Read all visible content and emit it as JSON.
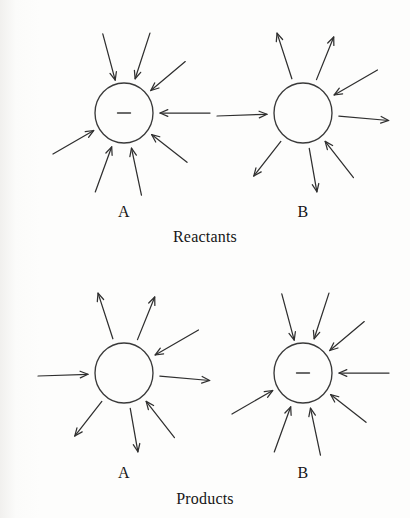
{
  "figure": {
    "kind": "reaction-energy-diagram",
    "page_background": "#fdfdfc",
    "ink_color": "#2f2f2f",
    "rows": [
      {
        "id": "reactants",
        "caption": "Reactants",
        "caption_x": 205,
        "caption_y": 228,
        "groups": [
          {
            "id": "reactant-a",
            "label": "A",
            "label_x": 124,
            "label_y": 203,
            "diagram_x": 28,
            "diagram_y": 8,
            "circle": {
              "cx": 96,
              "cy": 105,
              "rx": 29,
              "ry": 30
            },
            "charge": "minus",
            "charge_symbol": "−",
            "arrow_scheme": "all-inward",
            "arrow_count": 8,
            "arrows": [
              {
                "angle": 255,
                "direction": "inward",
                "tail": 82,
                "head": 34
              },
              {
                "angle": 288,
                "direction": "inward",
                "tail": 84,
                "head": 36
              },
              {
                "angle": 320,
                "direction": "inward",
                "tail": 80,
                "head": 35
              },
              {
                "angle": 0,
                "direction": "inward",
                "tail": 86,
                "head": 36
              },
              {
                "angle": 38,
                "direction": "inward",
                "tail": 80,
                "head": 35
              },
              {
                "angle": 78,
                "direction": "inward",
                "tail": 84,
                "head": 36
              },
              {
                "angle": 110,
                "direction": "inward",
                "tail": 84,
                "head": 36
              },
              {
                "angle": 150,
                "direction": "inward",
                "tail": 82,
                "head": 35
              }
            ]
          },
          {
            "id": "reactant-b",
            "label": "B",
            "label_x": 303,
            "label_y": 203,
            "diagram_x": 207,
            "diagram_y": 8,
            "circle": {
              "cx": 96,
              "cy": 105,
              "rx": 29,
              "ry": 30
            },
            "charge": "none",
            "charge_symbol": "",
            "arrow_scheme": "mixed",
            "arrow_count": 8,
            "arrows": [
              {
                "angle": 252,
                "direction": "outward",
                "tail": 36,
                "head": 84
              },
              {
                "angle": 292,
                "direction": "outward",
                "tail": 36,
                "head": 82
              },
              {
                "angle": 330,
                "direction": "inward",
                "tail": 86,
                "head": 36
              },
              {
                "angle": 5,
                "direction": "outward",
                "tail": 36,
                "head": 86
              },
              {
                "angle": 52,
                "direction": "inward",
                "tail": 82,
                "head": 36
              },
              {
                "angle": 80,
                "direction": "outward",
                "tail": 36,
                "head": 80
              },
              {
                "angle": 128,
                "direction": "outward",
                "tail": 36,
                "head": 80
              },
              {
                "angle": 178,
                "direction": "inward",
                "tail": 86,
                "head": 36
              }
            ]
          }
        ]
      },
      {
        "id": "products",
        "caption": "Products",
        "caption_x": 205,
        "caption_y": 490,
        "groups": [
          {
            "id": "product-a",
            "label": "A",
            "label_x": 124,
            "label_y": 464,
            "diagram_x": 28,
            "diagram_y": 268,
            "circle": {
              "cx": 96,
              "cy": 105,
              "rx": 29,
              "ry": 30
            },
            "charge": "none",
            "charge_symbol": "",
            "arrow_scheme": "mixed",
            "arrow_count": 8,
            "arrows": [
              {
                "angle": 252,
                "direction": "outward",
                "tail": 36,
                "head": 84
              },
              {
                "angle": 292,
                "direction": "outward",
                "tail": 36,
                "head": 82
              },
              {
                "angle": 330,
                "direction": "inward",
                "tail": 86,
                "head": 36
              },
              {
                "angle": 5,
                "direction": "outward",
                "tail": 36,
                "head": 86
              },
              {
                "angle": 52,
                "direction": "inward",
                "tail": 82,
                "head": 36
              },
              {
                "angle": 80,
                "direction": "outward",
                "tail": 36,
                "head": 80
              },
              {
                "angle": 128,
                "direction": "outward",
                "tail": 36,
                "head": 80
              },
              {
                "angle": 178,
                "direction": "inward",
                "tail": 86,
                "head": 36
              }
            ]
          },
          {
            "id": "product-b",
            "label": "B",
            "label_x": 303,
            "label_y": 464,
            "diagram_x": 207,
            "diagram_y": 268,
            "circle": {
              "cx": 96,
              "cy": 105,
              "rx": 29,
              "ry": 30
            },
            "charge": "minus",
            "charge_symbol": "−",
            "arrow_scheme": "all-inward",
            "arrow_count": 8,
            "arrows": [
              {
                "angle": 255,
                "direction": "inward",
                "tail": 82,
                "head": 34
              },
              {
                "angle": 288,
                "direction": "inward",
                "tail": 84,
                "head": 36
              },
              {
                "angle": 320,
                "direction": "inward",
                "tail": 80,
                "head": 35
              },
              {
                "angle": 0,
                "direction": "inward",
                "tail": 86,
                "head": 36
              },
              {
                "angle": 38,
                "direction": "inward",
                "tail": 80,
                "head": 35
              },
              {
                "angle": 78,
                "direction": "inward",
                "tail": 84,
                "head": 36
              },
              {
                "angle": 110,
                "direction": "inward",
                "tail": 84,
                "head": 36
              },
              {
                "angle": 150,
                "direction": "inward",
                "tail": 82,
                "head": 35
              }
            ]
          }
        ]
      }
    ],
    "margin_fragments": [
      {
        "text": "r",
        "y": 18
      },
      {
        "text": "e",
        "y": 60
      },
      {
        "text": "n",
        "y": 98
      },
      {
        "text": "o",
        "y": 134
      },
      {
        "text": "t",
        "y": 172
      },
      {
        "text": "b",
        "y": 210
      },
      {
        "text": "i",
        "y": 246
      },
      {
        "text": "c",
        "y": 286
      },
      {
        "text": "l",
        "y": 322
      },
      {
        "text": "h",
        "y": 356
      },
      {
        "text": "a",
        "y": 392
      },
      {
        "text": "e",
        "y": 424
      },
      {
        "text": "r",
        "y": 452
      },
      {
        "text": "t",
        "y": 486
      }
    ]
  }
}
